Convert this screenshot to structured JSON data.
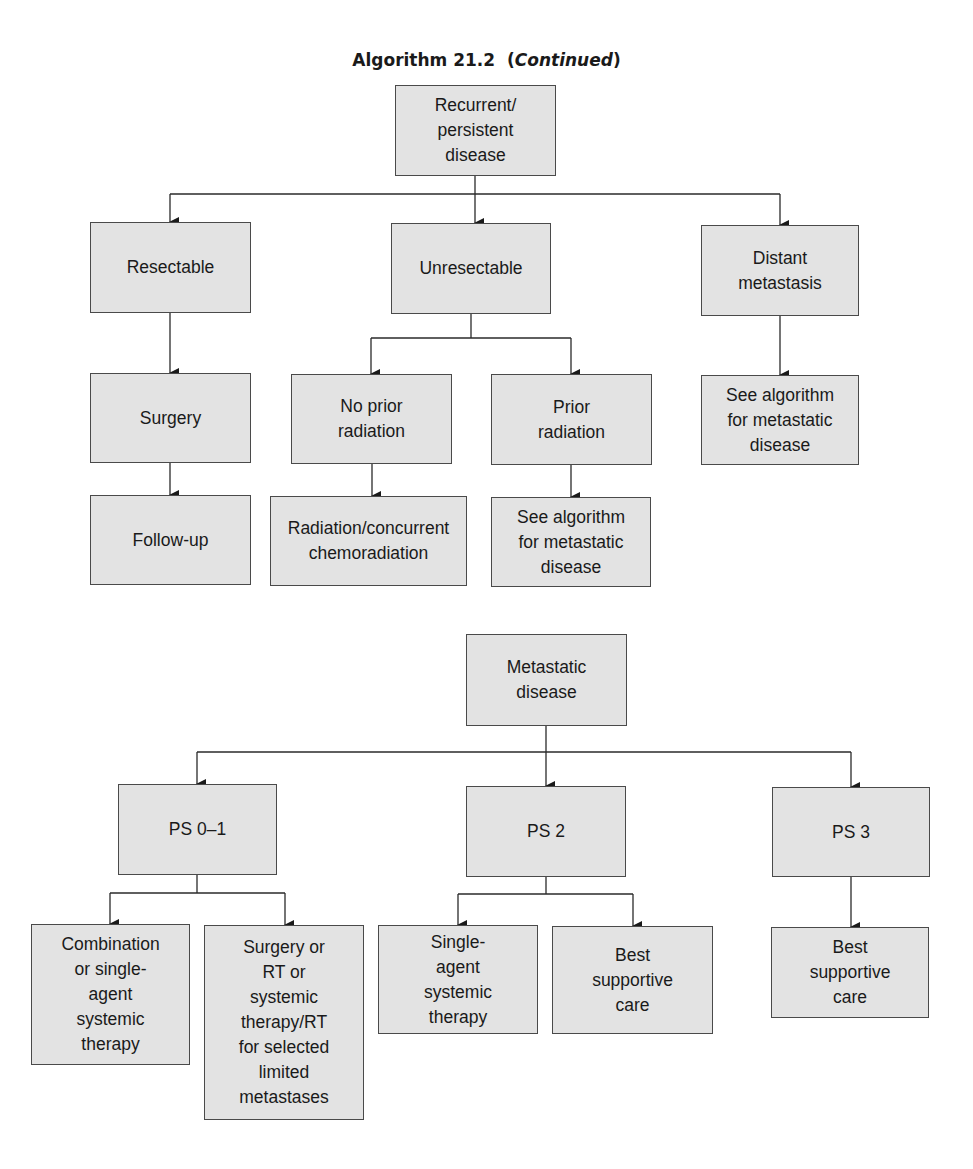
{
  "title": {
    "main": "Algorithm 21.2",
    "suffix": "Continued"
  },
  "section1": {
    "root": "Recurrent/\npersistent\ndisease",
    "branches": {
      "resectable": "Resectable",
      "unresectable": "Unresectable",
      "distant": "Distant\nmetastasis"
    },
    "resectable_path": {
      "surgery": "Surgery",
      "follow_up": "Follow-up"
    },
    "unresectable_path": {
      "no_prior": "No prior\nradiation",
      "prior": "Prior\nradiation",
      "no_prior_outcome": "Radiation/concurrent\nchemoradiation",
      "prior_outcome": "See algorithm\nfor metastatic\ndisease"
    },
    "distant_path": {
      "outcome": "See algorithm\nfor metastatic\ndisease"
    }
  },
  "section2": {
    "root": "Metastatic\ndisease",
    "branches": {
      "ps01": "PS 0–1",
      "ps2": "PS 2",
      "ps3": "PS 3"
    },
    "ps01_path": {
      "combination": "Combination\nor single-\nagent\nsystemic\ntherapy",
      "surgery_rt": "Surgery or\nRT or\nsystemic\ntherapy/RT\nfor selected\nlimited\nmetastases"
    },
    "ps2_path": {
      "single_agent": "Single-\nagent\nsystemic\ntherapy",
      "best_supportive": "Best\nsupportive\ncare"
    },
    "ps3_path": {
      "best_supportive": "Best\nsupportive\ncare"
    }
  },
  "colors": {
    "box_fill": "#e3e3e3",
    "box_border": "#4a4a4a",
    "line": "#2a2a2a"
  }
}
